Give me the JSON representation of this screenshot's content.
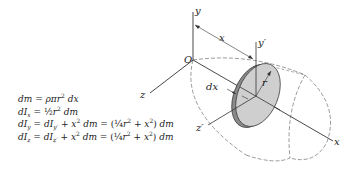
{
  "diagram": {
    "labels": {
      "origin": "O",
      "y_axis": "y",
      "x_axis": "x",
      "z_axis": "z",
      "x_distance": "x",
      "y_prime": "y′",
      "z_prime": "z′",
      "radius": "r",
      "thickness": "dx"
    },
    "colors": {
      "line": "#333333",
      "disk_face": "#c8c8c8",
      "disk_edge": "#8a8a8a",
      "dashed": "#555555"
    }
  },
  "equations": [
    {
      "id": "dm",
      "text": "dm = ρπr² dx"
    },
    {
      "id": "dIx",
      "text": "dIx = ½r² dm"
    },
    {
      "id": "dIy",
      "text": "dIy = dIy′ + x² dm = (¼r² + x²) dm"
    },
    {
      "id": "dIz",
      "text": "dIz = dIz′ + x² dm = (¼r² + x²) dm"
    }
  ]
}
